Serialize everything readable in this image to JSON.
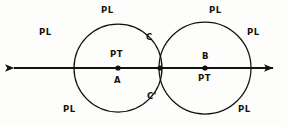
{
  "figure": {
    "type": "geometry-diagram",
    "background_color": "#fdfdfb",
    "ink_color": "#14120f"
  },
  "chart_data": {
    "type": "scatter",
    "title": "",
    "xlabel": "",
    "ylabel": "",
    "grid": false,
    "legend": "none",
    "xlim": [
      0,
      287
    ],
    "ylim": [
      0,
      126
    ],
    "line": {
      "name": "horizontal-line",
      "x1": 8,
      "y1": 68,
      "x2": 279,
      "y2": 68,
      "arrow_left": true,
      "arrow_right": true
    },
    "circles": [
      {
        "name": "circle-A",
        "cx": 118,
        "cy": 68,
        "r": 44
      },
      {
        "name": "circle-B",
        "cx": 205,
        "cy": 68,
        "r": 46
      }
    ],
    "points": [
      {
        "name": "A",
        "x": 118,
        "y": 68
      },
      {
        "name": "midpoint",
        "x": 160,
        "y": 68
      },
      {
        "name": "B",
        "x": 205,
        "y": 68
      }
    ]
  },
  "labels": {
    "point_a": {
      "text": "A",
      "x": 114,
      "y": 76
    },
    "point_b": {
      "text": "B",
      "x": 202,
      "y": 52
    },
    "pt_left": {
      "text": "PT",
      "x": 110,
      "y": 50
    },
    "pt_right": {
      "text": "PT",
      "x": 198,
      "y": 74
    },
    "c_upper": {
      "text": "C",
      "x": 146,
      "y": 33
    },
    "c_lower": {
      "text": "C'",
      "x": 147,
      "y": 92
    },
    "pl": [
      {
        "text": "PL",
        "x": 39,
        "y": 28
      },
      {
        "text": "PL",
        "x": 101,
        "y": 6
      },
      {
        "text": "PL",
        "x": 209,
        "y": 6
      },
      {
        "text": "PL",
        "x": 247,
        "y": 28
      },
      {
        "text": "PL",
        "x": 63,
        "y": 105
      },
      {
        "text": "PL",
        "x": 238,
        "y": 105
      }
    ]
  }
}
